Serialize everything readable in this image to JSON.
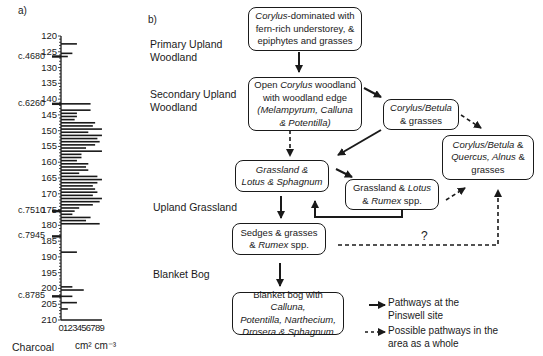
{
  "panel_a": {
    "label": "a)",
    "y_ticks": [
      "120",
      "125",
      "130",
      "135",
      "140",
      "145",
      "150",
      "155",
      "160",
      "165",
      "170",
      "175",
      "180",
      "185",
      "190",
      "195",
      "200",
      "205",
      "210"
    ],
    "date_markers": [
      {
        "label": "c.4680",
        "depth": 126.5
      },
      {
        "label": "c.6260",
        "depth": 141.5
      },
      {
        "label": "c.7510",
        "depth": 175.5
      },
      {
        "label": "c.7945",
        "depth": 183.5
      },
      {
        "label": "c.8785",
        "depth": 202.5
      }
    ],
    "x_ticks": [
      "0",
      "1",
      "2",
      "3",
      "4",
      "5",
      "6",
      "7",
      "8",
      "9"
    ],
    "xlabel_left": "Charcoal",
    "xlabel_units": "cm² cm⁻³"
  },
  "panel_b": {
    "label": "b)",
    "zones": [
      {
        "id": "primary",
        "line1": "Primary Upland",
        "line2": "Woodland"
      },
      {
        "id": "secondary",
        "line1": "Secondary Upland",
        "line2": "Woodland"
      },
      {
        "id": "grassland",
        "line1": "Upland Grassland",
        "line2": ""
      },
      {
        "id": "bog",
        "line1": "Blanket Bog",
        "line2": ""
      }
    ],
    "boxes": {
      "corylus_dominated": [
        "Corylus",
        "-dominated with",
        "fern-rich understorey, &",
        "epiphytes and grasses"
      ],
      "open_corylus": [
        "Open ",
        "Corylus",
        " woodland",
        "with woodland edge",
        "(Melampyrum, Calluna",
        "& Potentilla)"
      ],
      "corylus_betula": [
        "Corylus/Betula",
        "& grasses"
      ],
      "corylus_betula_quercus": [
        "Corylus/Betula",
        " &",
        "Quercus, Alnus",
        " &",
        "grasses"
      ],
      "grassland_lotus_sphagnum": [
        "Grassland &",
        "Lotus & Sphagnum"
      ],
      "grassland_lotus_rumex": [
        "Grassland & ",
        "Lotus",
        "& ",
        "Rumex",
        " spp."
      ],
      "sedges": [
        "Sedges & grasses",
        "& ",
        "Rumex",
        " spp."
      ],
      "blanket_bog": [
        "Blanket bog with ",
        "Calluna,",
        "Potentilla, Narthecium,",
        "Drosera & Sphagnum"
      ]
    },
    "question_mark": "?",
    "legend": {
      "solid_line1": "Pathways at the",
      "solid_line2": "Pinswell site",
      "dashed_line1": "Possible pathways in the",
      "dashed_line2": "area as a whole"
    }
  },
  "chart_data": {
    "type": "bar",
    "orientation": "horizontal",
    "title": "Charcoal",
    "ylabel": "Depth (cm)",
    "xlabel": "Charcoal cm² cm⁻³",
    "ylim": [
      120,
      210
    ],
    "xlim": [
      0,
      9
    ],
    "depths": [
      122.5,
      125.5,
      126.5,
      141.5,
      143.5,
      144.5,
      145.5,
      146.5,
      147.5,
      148.5,
      149.5,
      150.5,
      151.5,
      152.5,
      153.5,
      154.5,
      155.5,
      156.5,
      157.5,
      158.5,
      159.5,
      160.5,
      161.5,
      162.5,
      163.5,
      164.5,
      165.5,
      166.5,
      167.5,
      168.5,
      169.5,
      170.5,
      171.5,
      172.5,
      173.5,
      174.5,
      175.5,
      176.5,
      177.5,
      178.5,
      179.5,
      188.5,
      199.5,
      200.5,
      202.5,
      204.5,
      206.5
    ],
    "values": [
      3.5,
      2.5,
      1.5,
      6.5,
      6.5,
      3.5,
      3.5,
      3.0,
      7.5,
      7.0,
      9.0,
      6.0,
      9.0,
      8.0,
      8.5,
      7.5,
      5.5,
      9.0,
      4.5,
      4.5,
      3.5,
      6.0,
      5.5,
      6.0,
      4.0,
      8.0,
      9.0,
      8.0,
      7.0,
      7.5,
      8.0,
      7.0,
      9.0,
      8.5,
      7.0,
      4.0,
      3.0,
      2.5,
      6.5,
      5.5,
      8.5,
      3.5,
      2.5,
      5.0,
      2.5,
      3.5,
      1.5
    ],
    "annotations": [
      "c.4680",
      "c.6260",
      "c.7510",
      "c.7945",
      "c.8785"
    ]
  }
}
